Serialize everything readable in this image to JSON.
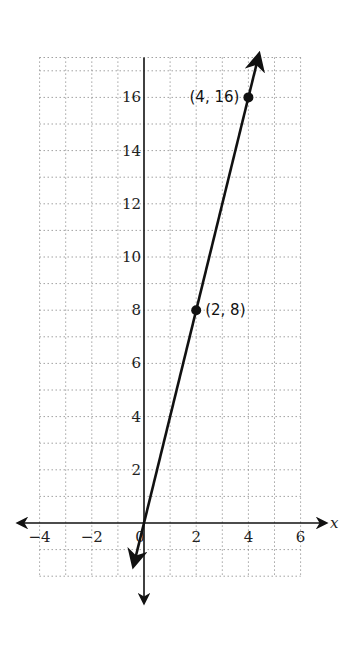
{
  "chart_data": {
    "type": "line",
    "title": "",
    "xlabel": "x",
    "ylabel": "",
    "xlim": [
      -4,
      6
    ],
    "ylim": [
      -2,
      17.5
    ],
    "grid": true,
    "grid_step": 1,
    "x_ticks": [
      -4,
      -2,
      0,
      2,
      4,
      6
    ],
    "x_tick_labels": [
      "−4",
      "−2",
      "0",
      "2",
      "4",
      "6"
    ],
    "y_ticks": [
      2,
      4,
      6,
      8,
      10,
      12,
      14,
      16
    ],
    "y_tick_labels": [
      "2",
      "4",
      "6",
      "8",
      "10",
      "12",
      "14",
      "16"
    ],
    "series": [
      {
        "name": "y = 4x",
        "equation": "y = 4x",
        "line_extends": [
          [
            -0.4,
            -1.6
          ],
          [
            4.4,
            17.6
          ]
        ],
        "points": [
          {
            "x": 2,
            "y": 8,
            "label": "(2, 8)"
          },
          {
            "x": 4,
            "y": 16,
            "label": "(4, 16)"
          }
        ]
      }
    ],
    "legend": null
  },
  "colors": {
    "line": "#111111",
    "grid": "#8a8a8a",
    "background": "#ffffff"
  }
}
